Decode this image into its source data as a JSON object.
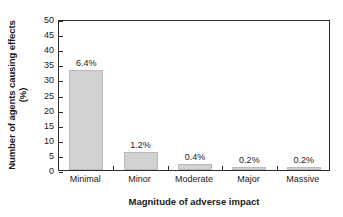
{
  "chart_data": {
    "type": "bar",
    "title": "",
    "subtitle": "",
    "xlabel": "Magnitude of adverse impact",
    "ylabel_line1": "Number of agents causing effects",
    "ylabel_line2": "(%)",
    "categories": [
      "Minimal",
      "Minor",
      "Moderate",
      "Major",
      "Massive"
    ],
    "values": [
      33,
      6,
      2,
      1,
      1
    ],
    "data_labels": [
      "6.4%",
      "1.2%",
      "0.4%",
      "0.2%",
      "0.2%"
    ],
    "ylim": [
      0,
      50
    ],
    "ytick_step": 5,
    "yticks": [
      "50",
      "45",
      "40",
      "35",
      "30",
      "25",
      "20",
      "15",
      "10",
      "5",
      "0"
    ],
    "ytick_values": [
      50,
      45,
      40,
      35,
      30,
      25,
      20,
      15,
      10,
      5,
      0
    ],
    "grid": false,
    "legend": false,
    "legend_position": "none",
    "bar_fill_color": "#d2d2d2",
    "bar_edge_color": "#b9b9b9",
    "axis_color": "#2b2b2b",
    "text_color": "#1a1a1a",
    "background_color": "#ffffff"
  }
}
